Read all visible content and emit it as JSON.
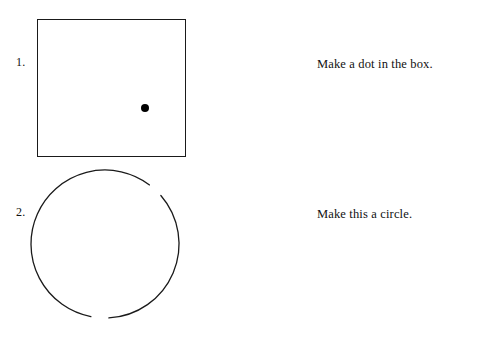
{
  "page": {
    "background_color": "#ffffff",
    "ink_color": "#1a1a1a",
    "width": 496,
    "height": 351
  },
  "items": [
    {
      "number_label": "1.",
      "instruction": "Make a dot in the box.",
      "figure": {
        "type": "square-with-dot",
        "square": {
          "x": 37,
          "y": 19,
          "width": 149,
          "height": 138,
          "stroke_color": "#1a1a1a"
        },
        "dot": {
          "cx": 107,
          "cy": 88,
          "diameter": 8,
          "fill_color": "#000000"
        }
      }
    },
    {
      "number_label": "2.",
      "instruction": "Make this a circle.",
      "figure": {
        "type": "broken-circle",
        "circle": {
          "cx": 105,
          "cy": 244,
          "radius": 74,
          "stroke_color": "#1a1a1a"
        },
        "gaps_degrees_from_top_clockwise": [
          {
            "start": 37,
            "end": 49
          },
          {
            "start": 177,
            "end": 191
          }
        ]
      }
    }
  ]
}
